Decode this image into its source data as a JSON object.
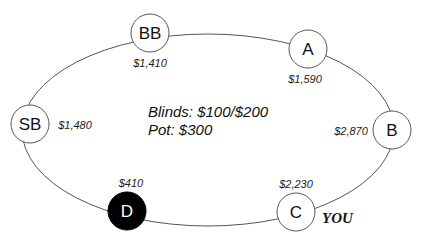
{
  "table": {
    "blinds_text": "Blinds: $100/$200",
    "pot_text": "Pot: $300",
    "you_label": "YOU"
  },
  "seats": [
    {
      "position": "BB",
      "stack": "$1,410",
      "dealer": false
    },
    {
      "position": "A",
      "stack": "$1,590",
      "dealer": false
    },
    {
      "position": "B",
      "stack": "$2,870",
      "dealer": false
    },
    {
      "position": "C",
      "stack": "$2,230",
      "dealer": false,
      "is_you": true
    },
    {
      "position": "D",
      "stack": "$410",
      "dealer": true
    },
    {
      "position": "SB",
      "stack": "$1,480",
      "dealer": false
    }
  ],
  "colors": {
    "line": "#555555",
    "dealer_fill": "#000000",
    "seat_fill": "#ffffff"
  }
}
